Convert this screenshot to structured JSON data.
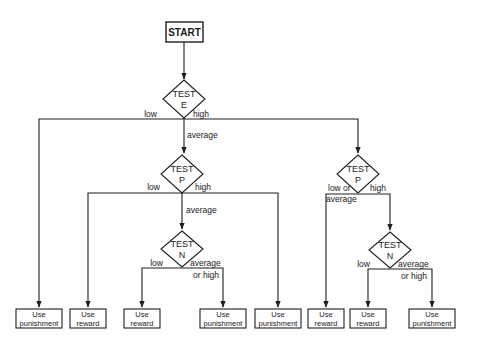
{
  "diagram": {
    "type": "flowchart",
    "start": {
      "label": "START"
    },
    "decisions": {
      "test_e": {
        "line1": "TEST",
        "line2": "E"
      },
      "test_p_mid": {
        "line1": "TEST",
        "line2": "P"
      },
      "test_n_mid": {
        "line1": "TEST",
        "line2": "N"
      },
      "test_p_right": {
        "line1": "TEST",
        "line2": "P"
      },
      "test_n_right": {
        "line1": "TEST",
        "line2": "N"
      }
    },
    "edge_labels": {
      "e_low": "low",
      "e_high": "high",
      "e_average": "average",
      "p_mid_low": "low",
      "p_mid_high": "high",
      "p_mid_average": "average",
      "n_mid_low": "low",
      "n_mid_avg_line1": "average",
      "n_mid_avg_line2": "or high",
      "p_right_low_line1": "low or",
      "p_right_low_line2": "average",
      "p_right_high": "high",
      "n_right_low": "low",
      "n_right_avg_line1": "average",
      "n_right_avg_line2": "or high"
    },
    "outcomes": [
      {
        "line1": "Use",
        "line2": "punishment"
      },
      {
        "line1": "Use",
        "line2": "reward"
      },
      {
        "line1": "Use",
        "line2": "reward"
      },
      {
        "line1": "Use",
        "line2": "punishment"
      },
      {
        "line1": "Use",
        "line2": "punishment"
      },
      {
        "line1": "Use",
        "line2": "reward"
      },
      {
        "line1": "Use",
        "line2": "reward"
      },
      {
        "line1": "Use",
        "line2": "punishment"
      }
    ]
  }
}
